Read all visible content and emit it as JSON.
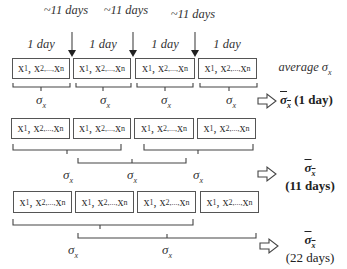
{
  "top_labels": {
    "intervals": [
      "~11 days",
      "~11 days",
      "~11 days"
    ],
    "boxes": [
      "1 day",
      "1 day",
      "1 day",
      "1 day"
    ]
  },
  "box_text": {
    "x1": "x",
    "x2": "x",
    "xn": "x",
    "sub1": "1",
    "sub2": "2,...,",
    "subn": "n"
  },
  "rows": [
    {
      "sigma_labels": [
        "σ",
        "σ",
        "σ",
        "σ"
      ],
      "sigma_sub": "x",
      "result": {
        "bar": "σ",
        "sub": "x",
        "period": "(1 day)"
      },
      "side_label": "average σ"
    },
    {
      "sigma_labels": [
        "σ",
        "σ",
        "σ"
      ],
      "sigma_sub": "x",
      "result": {
        "bar": "σ",
        "sub": "x",
        "period": "(11 days)"
      }
    },
    {
      "sigma_labels": [
        "σ",
        "σ"
      ],
      "sigma_sub": "x",
      "result": {
        "bar": "σ",
        "sub": "x",
        "period": "(22 days)"
      }
    }
  ],
  "side_label_sub": "x",
  "colors": {
    "line": "#555555",
    "text": "#222222"
  }
}
